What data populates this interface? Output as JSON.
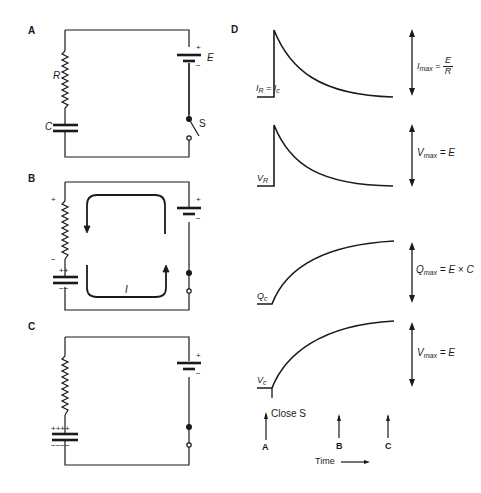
{
  "panels": {
    "A": {
      "label": "A",
      "resistor_label": "R",
      "capacitor_label": "C",
      "battery_label": "E",
      "battery_plus": "+",
      "battery_minus": "−",
      "switch_label": "S",
      "switch_state": "open"
    },
    "B": {
      "label": "B",
      "resistor_plus": "+",
      "resistor_minus": "−",
      "capacitor_top_charge": "++",
      "capacitor_bottom_charge": "−−",
      "battery_plus": "+",
      "battery_minus": "−",
      "current_label": "I",
      "switch_state": "closed"
    },
    "C": {
      "label": "C",
      "capacitor_top_charge": "++++",
      "capacitor_bottom_charge": "−−−−",
      "battery_plus": "+",
      "battery_minus": "−",
      "switch_state": "closed"
    },
    "D": {
      "label": "D",
      "graphs": [
        {
          "name": "current",
          "ylabel": "I",
          "ylabel_sub": "R",
          "ylabel_eq": " = ",
          "ylabel2": "I",
          "ylabel2_sub": "c",
          "max_label": "I",
          "max_sub": "max",
          "max_eq": " = ",
          "max_num": "E",
          "max_den": "R",
          "shape": "decay"
        },
        {
          "name": "resistor-voltage",
          "ylabel": "V",
          "ylabel_sub": "R",
          "max_label": "V",
          "max_sub": "max",
          "max_rhs": " = E",
          "shape": "decay"
        },
        {
          "name": "capacitor-charge",
          "ylabel": "Q",
          "ylabel_sub": "c",
          "max_label": "Q",
          "max_sub": "max",
          "max_rhs": " = E × C",
          "shape": "growth"
        },
        {
          "name": "capacitor-voltage",
          "ylabel": "V",
          "ylabel_sub": "c",
          "max_label": "V",
          "max_sub": "max",
          "max_rhs": " = E",
          "shape": "growth"
        }
      ],
      "close_switch_label": "Close S",
      "time_markers": [
        "A",
        "B",
        "C"
      ],
      "time_label": "Time"
    }
  }
}
